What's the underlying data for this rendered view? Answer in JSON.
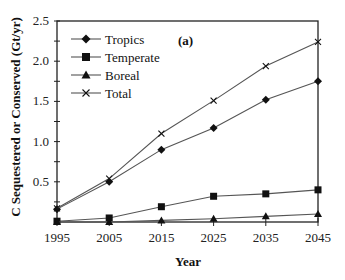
{
  "chart_data": {
    "type": "line",
    "title": "",
    "panel_label": "(a)",
    "xlabel": "Year",
    "ylabel": "C Sequestered or Conserved (Gt/yr)",
    "x": [
      1995,
      2005,
      2015,
      2025,
      2035,
      2045
    ],
    "xlim": [
      1995,
      2045
    ],
    "ylim": [
      0,
      2.5
    ],
    "yticks": [
      0.5,
      1.0,
      1.5,
      2.0,
      2.5
    ],
    "ytick_labels": [
      "0.5",
      "1.0",
      "1.5",
      "2.0",
      "2.5"
    ],
    "xtick_labels": [
      "1995",
      "2005",
      "2015",
      "2025",
      "2035",
      "2045"
    ],
    "grid": false,
    "legend_position": "upper left",
    "series": [
      {
        "name": "Tropics",
        "marker": "diamond",
        "values": [
          0.16,
          0.5,
          0.9,
          1.17,
          1.52,
          1.75
        ]
      },
      {
        "name": "Temperate",
        "marker": "square",
        "values": [
          0.01,
          0.05,
          0.19,
          0.32,
          0.35,
          0.4
        ]
      },
      {
        "name": "Boreal",
        "marker": "triangle",
        "values": [
          0.0,
          0.0,
          0.02,
          0.04,
          0.07,
          0.1
        ]
      },
      {
        "name": "Total",
        "marker": "x",
        "values": [
          0.17,
          0.54,
          1.1,
          1.51,
          1.94,
          2.24
        ]
      }
    ],
    "colors": {
      "line": "#555555",
      "marker": "#111111",
      "axis": "#222222"
    }
  }
}
